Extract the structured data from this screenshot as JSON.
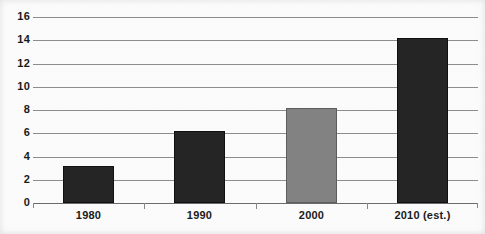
{
  "chart_data": {
    "type": "bar",
    "title": "",
    "subtitle": "",
    "xlabel": "",
    "ylabel": "",
    "categories": [
      "1980",
      "1990",
      "2000",
      "2010 (est.)"
    ],
    "values": [
      3,
      6,
      8,
      14
    ],
    "series": [
      {
        "name": "",
        "values": [
          3,
          6,
          8,
          14
        ]
      }
    ],
    "bar_colors": [
      "#262626",
      "#262626",
      "#848484",
      "#262626"
    ],
    "ylim": [
      0,
      16
    ],
    "yticks": [
      0,
      2,
      4,
      6,
      8,
      10,
      12,
      14,
      16
    ],
    "ytick_labels": [
      "0",
      "2",
      "4",
      "6",
      "8",
      "10",
      "12",
      "14",
      "16"
    ],
    "xtick_labels": [
      "1980",
      "1990",
      "2000",
      "2010 (est.)"
    ],
    "grid": true,
    "grid_axis": "y",
    "grid_color": "#8f8f8f",
    "legend": false,
    "legend_position": "none",
    "annotations": [],
    "data_labels": false,
    "axis_color": "#6d6d6d",
    "text_color": "#1b1b1b",
    "background_color": "#ffffff"
  }
}
